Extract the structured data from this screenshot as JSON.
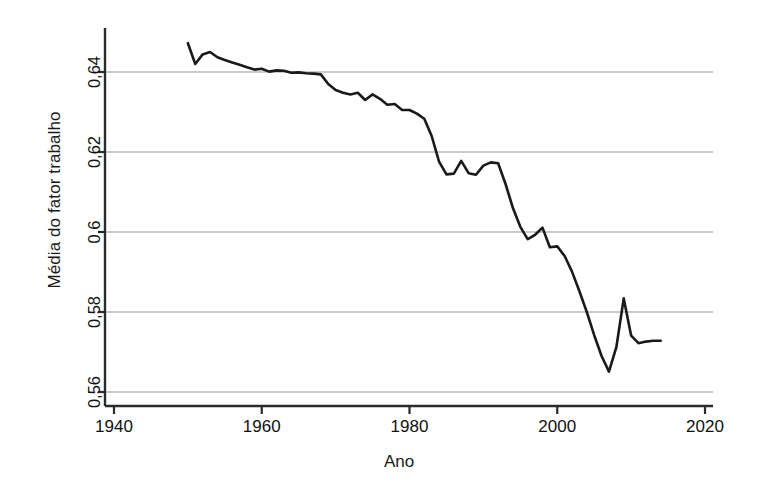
{
  "chart_data": {
    "type": "line",
    "title": "",
    "xlabel": "Ano",
    "ylabel": "Média do fator trabalho",
    "xlim": [
      1940,
      2020
    ],
    "ylim": [
      0.5555,
      0.6495
    ],
    "grid": true,
    "legend": false,
    "legend_position": "none",
    "xticks": [
      1940,
      1960,
      1980,
      2000,
      2020
    ],
    "xtick_labels": [
      "1940",
      "1960",
      "1980",
      "2000",
      "2020"
    ],
    "yticks": [
      0.56,
      0.58,
      0.6,
      0.62,
      0.64
    ],
    "ytick_labels": [
      "0,56",
      "0,58",
      "0,6",
      "0,62",
      "0,64"
    ],
    "line_color": "#1a1a1a",
    "grid_color": "#b9b9b9",
    "axis_color": "#2b2b2b",
    "series": [
      {
        "name": "Média do fator trabalho",
        "x": [
          1950,
          1951,
          1952,
          1953,
          1954,
          1955,
          1956,
          1957,
          1958,
          1959,
          1960,
          1961,
          1962,
          1963,
          1964,
          1965,
          1966,
          1967,
          1968,
          1969,
          1970,
          1971,
          1972,
          1973,
          1974,
          1975,
          1976,
          1977,
          1978,
          1979,
          1980,
          1981,
          1982,
          1983,
          1984,
          1985,
          1986,
          1987,
          1988,
          1989,
          1990,
          1991,
          1992,
          1993,
          1994,
          1995,
          1996,
          1997,
          1998,
          1999,
          2000,
          2001,
          2002,
          2003,
          2004,
          2005,
          2006,
          2007,
          2008,
          2009,
          2010,
          2011,
          2012,
          2013,
          2014
        ],
        "values": [
          0.6472,
          0.642,
          0.6444,
          0.645,
          0.6437,
          0.643,
          0.6424,
          0.6418,
          0.6412,
          0.6406,
          0.6408,
          0.6401,
          0.6404,
          0.6403,
          0.6398,
          0.6399,
          0.6397,
          0.6396,
          0.6394,
          0.637,
          0.6355,
          0.6348,
          0.6344,
          0.6348,
          0.633,
          0.6344,
          0.6333,
          0.6318,
          0.632,
          0.6305,
          0.6305,
          0.6296,
          0.6283,
          0.624,
          0.6176,
          0.6144,
          0.6146,
          0.6178,
          0.6147,
          0.6143,
          0.6166,
          0.6174,
          0.6172,
          0.612,
          0.606,
          0.6013,
          0.5982,
          0.5993,
          0.6011,
          0.5962,
          0.5964,
          0.594,
          0.5901,
          0.5852,
          0.58,
          0.5742,
          0.569,
          0.5651,
          0.5712,
          0.5834,
          0.5741,
          0.5722,
          0.5726,
          0.5728,
          0.5728
        ]
      }
    ]
  },
  "axis_labels": {
    "x_title": "Ano",
    "y_title": "Média do fator trabalho"
  }
}
